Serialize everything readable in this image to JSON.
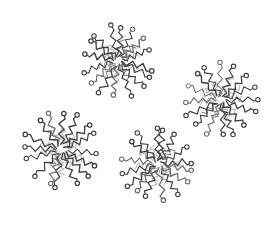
{
  "figure": {
    "background_color": "#ffffff"
  },
  "illustration": {
    "canvas": {
      "width": 280,
      "height": 225
    },
    "stroke_colors": {
      "dark": "#3f3f3f",
      "mid": "#6f6f6f",
      "light": "#a8a8a8"
    },
    "head_fill": "#ffffff",
    "head_radius": 2.2,
    "micelles": [
      {
        "label": "micelle-top",
        "cx": 118,
        "cy": 61,
        "radius": 42,
        "chains": 16,
        "filler_chains": 10,
        "rotation_deg": 8,
        "seed": 11
      },
      {
        "label": "micelle-right",
        "cx": 221,
        "cy": 100,
        "radius": 43,
        "chains": 16,
        "filler_chains": 10,
        "rotation_deg": 21,
        "seed": 22
      },
      {
        "label": "micelle-bottom-left",
        "cx": 61,
        "cy": 150,
        "radius": 45,
        "chains": 16,
        "filler_chains": 10,
        "rotation_deg": 2,
        "seed": 33
      },
      {
        "label": "micelle-bottom-center",
        "cx": 158,
        "cy": 164,
        "radius": 43,
        "chains": 16,
        "filler_chains": 10,
        "rotation_deg": 14,
        "seed": 44
      }
    ]
  }
}
